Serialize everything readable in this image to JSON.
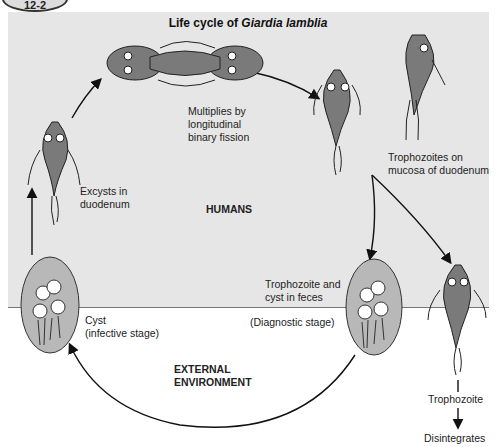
{
  "figure": {
    "badge": "12-2",
    "title_prefix": "Life cycle of ",
    "title_species": "Giardia lamblia"
  },
  "regions": {
    "humans": "HUMANS",
    "external": "EXTERNAL\nENVIRONMENT"
  },
  "stages": {
    "fission": "Multiplies by\nlongitudinal\nbinary fission",
    "mucosa": "Trophozoites on\nmucosa of duodenum",
    "excysts": "Excysts in\nduodenum",
    "feces": "Trophozoite and\ncyst in feces",
    "diagnostic": "(Diagnostic stage)",
    "cyst": "Cyst\n(infective stage)",
    "trophozoite": "Trophozoite",
    "disintegrates": "Disintegrates"
  },
  "colors": {
    "panel": "#e6e6e6",
    "organism": "#7a7a7a",
    "cyst": "#b8b8b8"
  }
}
